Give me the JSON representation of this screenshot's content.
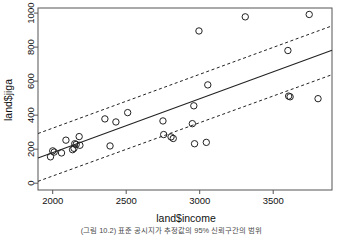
{
  "figure": {
    "caption": "(그림 10.2) 표준 공시지가 추정값의 95% 신뢰구간의 범위"
  },
  "chart_data": {
    "type": "scatter",
    "title": "",
    "xlabel": "land$income",
    "ylabel": "land$jiga",
    "xlim": [
      1900,
      3900
    ],
    "ylim": [
      -40,
      1030
    ],
    "xticks": [
      2000,
      2500,
      3000,
      3500
    ],
    "yticks": [
      0,
      200,
      400,
      600,
      800,
      1000
    ],
    "grid": false,
    "legend": null,
    "point_style": {
      "marker": "open-circle",
      "radius": 3.2,
      "color": "#222222"
    },
    "points": [
      {
        "x": 1985,
        "y": 155
      },
      {
        "x": 2000,
        "y": 190
      },
      {
        "x": 2010,
        "y": 183
      },
      {
        "x": 2060,
        "y": 178
      },
      {
        "x": 2090,
        "y": 253
      },
      {
        "x": 2135,
        "y": 197
      },
      {
        "x": 2145,
        "y": 205
      },
      {
        "x": 2150,
        "y": 232
      },
      {
        "x": 2160,
        "y": 228
      },
      {
        "x": 2180,
        "y": 274
      },
      {
        "x": 2185,
        "y": 223
      },
      {
        "x": 2355,
        "y": 378
      },
      {
        "x": 2390,
        "y": 219
      },
      {
        "x": 2430,
        "y": 360
      },
      {
        "x": 2510,
        "y": 415
      },
      {
        "x": 2750,
        "y": 366
      },
      {
        "x": 2755,
        "y": 286
      },
      {
        "x": 2805,
        "y": 272
      },
      {
        "x": 2820,
        "y": 263
      },
      {
        "x": 2950,
        "y": 350
      },
      {
        "x": 2960,
        "y": 455
      },
      {
        "x": 2965,
        "y": 232
      },
      {
        "x": 2995,
        "y": 895
      },
      {
        "x": 3045,
        "y": 240
      },
      {
        "x": 3055,
        "y": 578
      },
      {
        "x": 3310,
        "y": 978
      },
      {
        "x": 3600,
        "y": 780
      },
      {
        "x": 3605,
        "y": 512
      },
      {
        "x": 3615,
        "y": 508
      },
      {
        "x": 3745,
        "y": 992
      },
      {
        "x": 3805,
        "y": 497
      }
    ],
    "fit_line": {
      "style": "solid",
      "color": "#222222",
      "x0": 1900,
      "y0": 148,
      "x1": 3900,
      "y1": 782
    },
    "bands": [
      {
        "name": "upper-confidence-band",
        "style": "dashed",
        "color": "#222222",
        "x0": 1900,
        "y0": 292,
        "x1": 3900,
        "y1": 925
      },
      {
        "name": "lower-confidence-band",
        "style": "dashed",
        "color": "#222222",
        "x0": 1900,
        "y0": 11,
        "x1": 3900,
        "y1": 638
      }
    ]
  }
}
